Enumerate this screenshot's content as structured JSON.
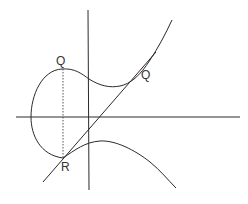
{
  "diagram": {
    "labels": {
      "q_top": "Q",
      "q_tangent": "Q",
      "r": "R"
    },
    "colors": {
      "stroke": "#2a2a2a",
      "background": "#ffffff"
    }
  }
}
